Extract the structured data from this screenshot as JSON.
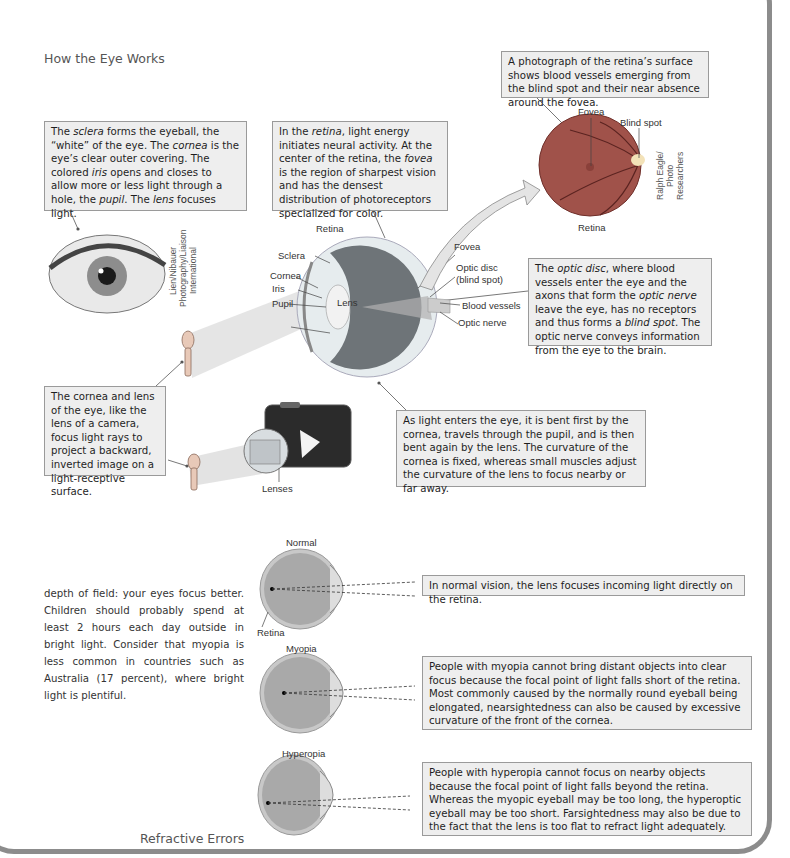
{
  "headings": {
    "main_title": "How the Eye Works",
    "refractive_title": "Refractive Errors"
  },
  "callouts": {
    "sclera_box": {
      "parts": [
        "The ",
        "sclera",
        " forms the eyeball, the “white” of the eye. The ",
        "cornea",
        " is the eye’s clear outer  covering. The colored ",
        "iris",
        " opens and closes to allow more or less light through a hole, the ",
        "pupil",
        ". The ",
        "lens",
        " focuses light."
      ]
    },
    "retina_box": {
      "parts": [
        "In the ",
        "retina",
        ", light energy initiates neural activity. At the center of the retina, the ",
        "fovea",
        " is the region of sharpest vision and has the densest distribution of photoreceptors specialized for color."
      ]
    },
    "photo_box": "A photograph of the retina’s surface shows blood vessels emerging from the blind spot and their near absence around the fovea.",
    "optic_disc_box": {
      "parts": [
        "The ",
        "optic disc",
        ", where blood vessels enter the eye and the axons that form the ",
        "optic nerve",
        " leave the eye, has no receptors and thus forms a ",
        "blind spot",
        ". The optic nerve conveys information from the eye to the brain."
      ]
    },
    "camera_box": "The cornea and lens of the eye, like the lens of a camera, focus light rays to project a backward, inverted image on a light-receptive surface.",
    "light_box": "As light enters the eye, it is bent first by the cornea, travels through the pupil, and is then bent again by the lens. The curvature of the cornea is fixed, whereas small muscles adjust the curvature of the lens to focus nearby or far away.",
    "normal_box": "In normal vision, the lens focuses incoming light directly on the retina.",
    "myopia_box": "People with myopia cannot bring distant objects into clear focus because the focal point of light falls short of the retina. Most commonly caused by the normally round eyeball being elongated, nearsightedness can also be caused by excessive curvature of the front of the cornea.",
    "hyperopia_box": "People with hyperopia cannot focus on nearby objects because the focal point of light falls beyond the retina. Whereas the myopic eyeball may be too long, the hyperoptic eyeball may be too short. Farsightedness may also be due to the fact that the lens is too flat to refract light adequately."
  },
  "eye_labels": {
    "retina": "Retina",
    "sclera": "Sclera",
    "cornea": "Cornea",
    "iris": "Iris",
    "pupil": "Pupil",
    "lens": "Lens",
    "fovea": "Fovea",
    "optic_disc": "Optic disc",
    "blind_spot_paren": "(blind spot)",
    "blood_vessels": "Blood vessels",
    "optic_nerve": "Optic nerve"
  },
  "photo_labels": {
    "fovea": "Fovea",
    "blind_spot": "Blind spot",
    "retina": "Retina"
  },
  "camera_labels": {
    "lenses": "Lenses"
  },
  "credits": {
    "eye_photo": "Lien/Nibauer Photography/Liaison International",
    "retina_photo": "Ralph Eagle/ Photo Researchers"
  },
  "refractive_labels": {
    "normal": "Normal",
    "retina": "Retina",
    "myopia": "Myopia",
    "hyperopia": "Hyperopia"
  },
  "body_text": "depth of field: your eyes focus better. Children should probably spend at least 2 hours each day outside in bright light. Consider that myopia is less common in countries such as Australia (17 percent), where bright light is plentiful.",
  "colors": {
    "callout_bg": "#eeeeee",
    "callout_border": "#9a9a9a",
    "frame": "#8c8c8c",
    "retina_red": "#a0524a"
  }
}
